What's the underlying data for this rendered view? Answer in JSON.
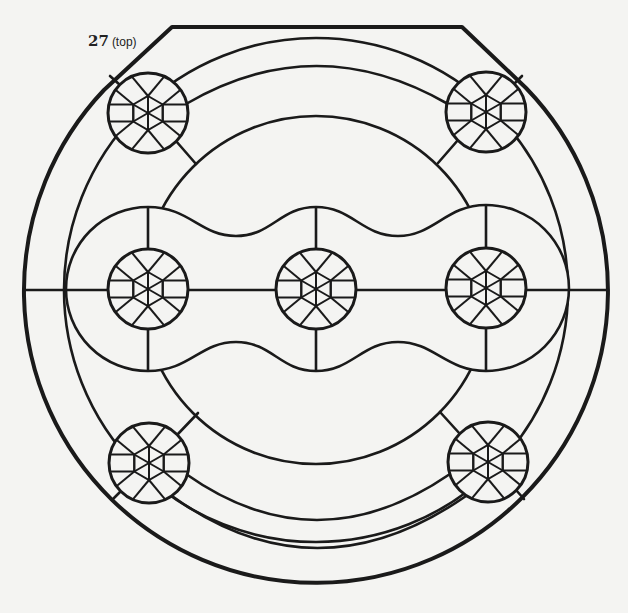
{
  "label": {
    "number": "27",
    "suffix": "(top)"
  },
  "colors": {
    "background": "#f4f4f2",
    "stroke": "#1a1a1a",
    "fill": "#f4f4f2"
  },
  "diagram": {
    "type": "stained-glass-pattern",
    "center": [
      316,
      290
    ],
    "outer_circle_r": 292,
    "top_flat": {
      "y": 27,
      "x1": 172,
      "x2": 462
    },
    "ring2_r": 252,
    "inner_circle_r": 174,
    "medallion_r": 40,
    "medallions": [
      {
        "id": "top-left",
        "cx": 148,
        "cy": 113
      },
      {
        "id": "top-right",
        "cx": 486,
        "cy": 112
      },
      {
        "id": "middle-left",
        "cx": 148,
        "cy": 289
      },
      {
        "id": "center",
        "cx": 316,
        "cy": 289
      },
      {
        "id": "middle-right",
        "cx": 486,
        "cy": 288
      },
      {
        "id": "bottom-left",
        "cx": 149,
        "cy": 463
      },
      {
        "id": "bottom-right",
        "cx": 488,
        "cy": 462
      }
    ]
  }
}
